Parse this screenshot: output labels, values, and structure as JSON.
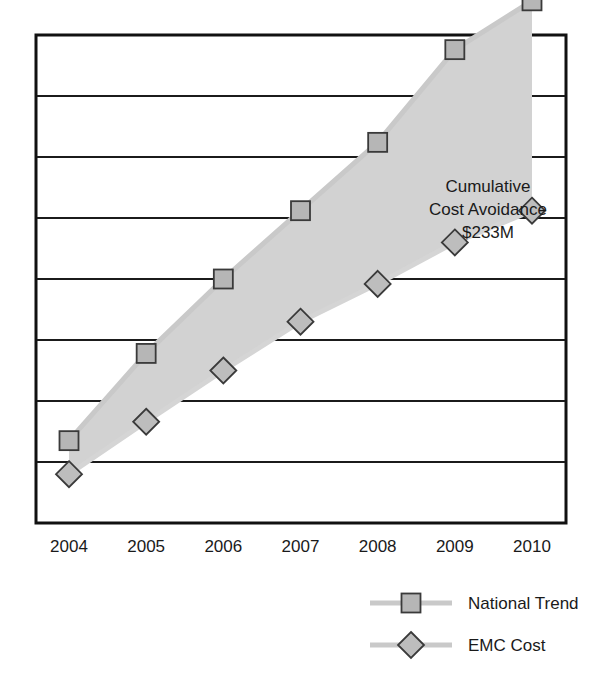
{
  "chart_data": {
    "type": "line",
    "title": "",
    "subtitle": "",
    "xlabel": "",
    "ylabel": "",
    "grid": true,
    "legend_position": "bottom-right",
    "categories": [
      "2004",
      "2005",
      "2006",
      "2007",
      "2008",
      "2009",
      "2010"
    ],
    "x": [
      2004,
      2005,
      2006,
      2007,
      2008,
      2009,
      2010
    ],
    "ylim": [
      0,
      8
    ],
    "y_gridline_values": [
      1,
      2,
      3,
      4,
      5,
      6,
      7,
      8
    ],
    "y_axis_tick_labels": [],
    "series": [
      {
        "name": "National Trend",
        "marker": "square",
        "values": [
          1.35,
          2.78,
          4.0,
          5.12,
          6.24,
          7.76,
          8.56
        ]
      },
      {
        "name": "EMC Cost",
        "marker": "diamond",
        "values": [
          0.8,
          1.66,
          2.5,
          3.3,
          3.92,
          4.6,
          5.12
        ]
      }
    ],
    "annotations": [
      {
        "lines": [
          "Cumulative",
          "Cost Avoidance",
          "$233M"
        ],
        "region": "area-between-series"
      }
    ]
  },
  "annotation": {
    "line1": "Cumulative",
    "line2": "Cost Avoidance",
    "line3": "$233M"
  },
  "axis": {
    "ticks": [
      {
        "label": "2004"
      },
      {
        "label": "2005"
      },
      {
        "label": "2006"
      },
      {
        "label": "2007"
      },
      {
        "label": "2008"
      },
      {
        "label": "2009"
      },
      {
        "label": "2010"
      }
    ]
  },
  "legend": {
    "items": [
      {
        "label": "National Trend",
        "marker": "square"
      },
      {
        "label": "EMC Cost",
        "marker": "diamond"
      }
    ]
  },
  "colors": {
    "band_fill": "#d2d2d2",
    "marker_fill": "#b6b6b6",
    "marker_stroke": "#3a3a3a",
    "line": "#c9c9c9",
    "gridline": "#1b1b1b",
    "frame": "#111111",
    "text": "#1a1a1a",
    "background": "#ffffff"
  }
}
